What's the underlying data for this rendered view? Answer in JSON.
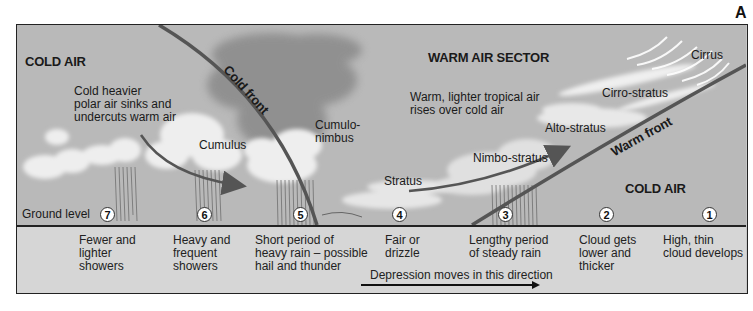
{
  "figure": {
    "letter": "A"
  },
  "regions": {
    "cold_air_left": "COLD AIR",
    "warm_air_sector": "WARM AIR SECTOR",
    "cold_air_right": "COLD AIR"
  },
  "notes": {
    "cold_air_line1": "Cold heavier",
    "cold_air_line2": "polar air sinks and",
    "cold_air_line3": "undercuts warm air",
    "warm_air_line1": "Warm, lighter tropical air",
    "warm_air_line2": "rises over cold air"
  },
  "fronts": {
    "cold_front": "Cold front",
    "warm_front": "Warm front"
  },
  "clouds": {
    "cumulus": "Cumulus",
    "cumulonimbus_line1": "Cumulo-",
    "cumulonimbus_line2": "nimbus",
    "stratus": "Stratus",
    "nimbostratus": "Nimbo-stratus",
    "altostratus": "Alto-stratus",
    "cirrostratus": "Cirro-stratus",
    "cirrus": "Cirrus"
  },
  "ground_level_label": "Ground level",
  "stages": [
    {
      "num": "7",
      "lines": [
        "Fewer and",
        "lighter",
        "showers"
      ]
    },
    {
      "num": "6",
      "lines": [
        "Heavy and",
        "frequent",
        "showers"
      ]
    },
    {
      "num": "5",
      "lines": [
        "Short period of",
        "heavy rain – possible",
        "hail and thunder"
      ]
    },
    {
      "num": "4",
      "lines": [
        "Fair or",
        "drizzle"
      ]
    },
    {
      "num": "3",
      "lines": [
        "Lengthy period",
        "of steady rain"
      ]
    },
    {
      "num": "2",
      "lines": [
        "Cloud gets",
        "lower and",
        "thicker"
      ]
    },
    {
      "num": "1",
      "lines": [
        "High, thin",
        "cloud develops"
      ]
    }
  ],
  "direction_label": "Depression moves in this direction",
  "colors": {
    "sky": "#b9b9b9",
    "strip": "#d6d6d6",
    "front_line": "#5a5a5a",
    "cloud": "#f2f2f2",
    "storm_cloud": "#8a8a8a"
  }
}
